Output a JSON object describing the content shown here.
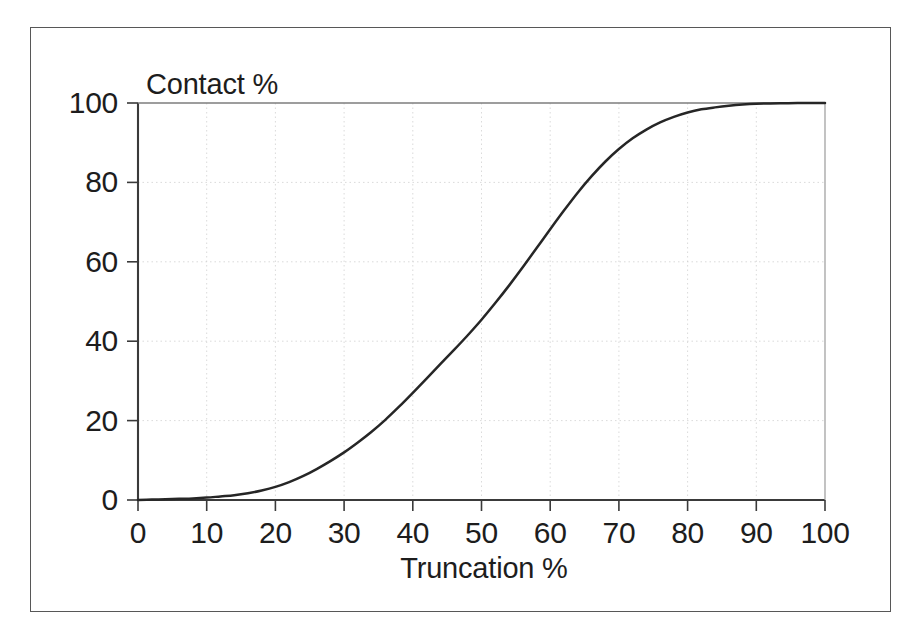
{
  "figure": {
    "background_color": "#ffffff",
    "frame_color": "#575757",
    "axis_color": "#3a3a3a",
    "grid_color": "#cfcfcf",
    "curve_color": "#262626",
    "text_color": "#1d1d1d"
  },
  "chart_data": {
    "type": "line",
    "title": "",
    "subtitle": "",
    "xlabel": "Truncation %",
    "ylabel": "Contact %",
    "xlim": [
      0,
      100
    ],
    "ylim": [
      0,
      100
    ],
    "grid": true,
    "legend": null,
    "legend_position": "none",
    "x_ticks": [
      0,
      10,
      20,
      30,
      40,
      50,
      60,
      70,
      80,
      90,
      100
    ],
    "x_tick_labels": [
      "0",
      "10",
      "20",
      "30",
      "40",
      "50",
      "60",
      "70",
      "80",
      "90",
      "100"
    ],
    "y_ticks": [
      0,
      20,
      40,
      60,
      80,
      100
    ],
    "y_tick_labels": [
      "0",
      "20",
      "40",
      "60",
      "80",
      "100"
    ],
    "x_gridlines": [
      10,
      20,
      30,
      40,
      50,
      60,
      70,
      80,
      90
    ],
    "y_gridlines": [
      20,
      40,
      60,
      80
    ],
    "series": [
      {
        "name": "Contact vs Truncation",
        "x": [
          0,
          2,
          4,
          6,
          8,
          10,
          12,
          14,
          16,
          18,
          20,
          22,
          24,
          26,
          28,
          30,
          32,
          34,
          36,
          38,
          40,
          42,
          44,
          46,
          48,
          50,
          52,
          54,
          56,
          58,
          60,
          62,
          64,
          66,
          68,
          70,
          72,
          74,
          76,
          78,
          80,
          82,
          84,
          86,
          88,
          90,
          92,
          94,
          96,
          98,
          100
        ],
        "y": [
          0.0,
          0.1,
          0.2,
          0.3,
          0.4,
          0.6,
          0.9,
          1.2,
          1.7,
          2.4,
          3.3,
          4.5,
          6.0,
          7.8,
          9.8,
          12.0,
          14.5,
          17.2,
          20.2,
          23.5,
          27.0,
          30.6,
          34.2,
          37.8,
          41.5,
          45.4,
          49.6,
          54.0,
          58.6,
          63.4,
          68.2,
          72.9,
          77.4,
          81.5,
          85.2,
          88.4,
          91.1,
          93.3,
          95.1,
          96.5,
          97.6,
          98.4,
          98.9,
          99.3,
          99.6,
          99.8,
          99.9,
          99.95,
          100.0,
          100.0,
          100.0
        ]
      }
    ],
    "annotations": []
  },
  "labels": {
    "y_axis_title": "Contact %",
    "x_axis_title": "Truncation %"
  }
}
